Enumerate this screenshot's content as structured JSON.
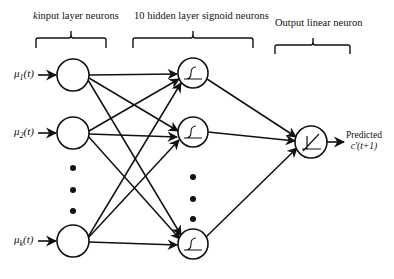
{
  "diagram": {
    "type": "neural-network",
    "layers": {
      "input": {
        "header": "k",
        "header_rest": "input layer neurons",
        "inputs": [
          {
            "symbol": "μ",
            "sub": "1",
            "arg": "(t)"
          },
          {
            "symbol": "μ",
            "sub": "2",
            "arg": "(t)"
          },
          {
            "symbol": "μ",
            "sub": "k",
            "arg": "(t)"
          }
        ]
      },
      "hidden": {
        "header": "10 hidden layer signoid neurons",
        "activation": "sigmoid-icon"
      },
      "output": {
        "header": "Output linear neuron",
        "activation": "linear-icon",
        "label_line1": "Predicted",
        "label_line2": "c'(t+1)"
      }
    },
    "colors": {
      "stroke": "#111111",
      "background": "#ffffff"
    }
  }
}
